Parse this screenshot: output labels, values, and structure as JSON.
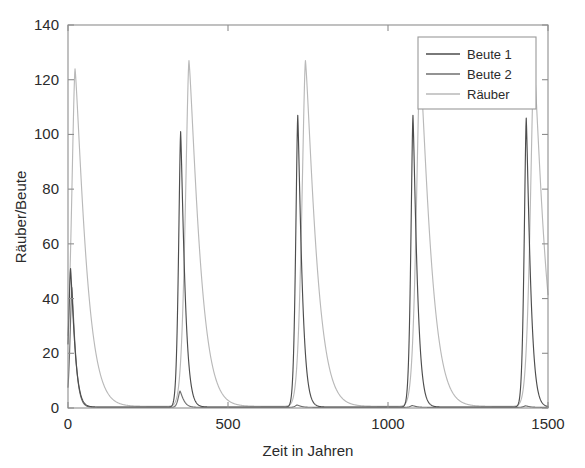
{
  "chart_data": {
    "type": "line",
    "title": "",
    "xlabel": "Zeit in Jahren",
    "ylabel": "Räuber/Beute",
    "xlim": [
      0,
      1500
    ],
    "ylim": [
      0,
      140
    ],
    "xticks": [
      0,
      500,
      1000,
      1500
    ],
    "xtick_labels": [
      "0",
      "500",
      "1000",
      "1500"
    ],
    "yticks": [
      0,
      20,
      40,
      60,
      80,
      100,
      120,
      140
    ],
    "ytick_labels": [
      "0",
      "20",
      "40",
      "60",
      "80",
      "100",
      "120",
      "140"
    ],
    "grid": false,
    "legend_position": "upper right",
    "series": [
      {
        "name": "Beute 1",
        "color": "#4d4d4d",
        "peaks": [
          {
            "x": 8,
            "y": 51
          },
          {
            "x": 352,
            "y": 101
          },
          {
            "x": 718,
            "y": 107
          },
          {
            "x": 1078,
            "y": 107
          },
          {
            "x": 1432,
            "y": 106
          }
        ],
        "baseline": 0.35,
        "peak_width": 17
      },
      {
        "name": "Beute 2",
        "color": "#6f6f6f",
        "peaks": [
          {
            "x": 12,
            "y": 44
          },
          {
            "x": 350,
            "y": 6.2
          },
          {
            "x": 716,
            "y": 1.1
          },
          {
            "x": 1076,
            "y": 0.9
          },
          {
            "x": 1430,
            "y": 0.8
          }
        ],
        "baseline": 0.25,
        "peak_width": 15
      },
      {
        "name": "Räuber",
        "color": "#b9b9b9",
        "peaks": [
          {
            "x": 22,
            "y": 124
          },
          {
            "x": 378,
            "y": 127
          },
          {
            "x": 742,
            "y": 127
          },
          {
            "x": 1100,
            "y": 127
          },
          {
            "x": 1456,
            "y": 127
          }
        ],
        "baseline": 0.6,
        "peak_width": 30,
        "decay_tail": 95
      }
    ],
    "legend_entries": [
      "Beute 1",
      "Beute 2",
      "Räuber"
    ]
  },
  "axes": {
    "x_axis_title": "Zeit in Jahren",
    "y_axis_title": "Räuber/Beute"
  },
  "colors": {
    "axis": "#8e8e8e",
    "text": "#2b2b2b",
    "background": "#ffffff",
    "legend_border": "#9a9a9a"
  }
}
